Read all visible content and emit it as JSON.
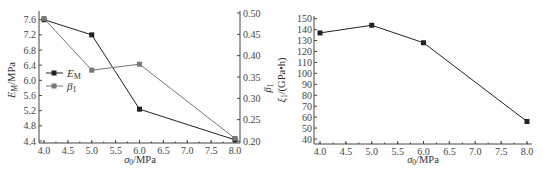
{
  "chart_data": [
    {
      "type": "line",
      "title": "",
      "xlabel": "σ0/MPa",
      "ylabel": "EM/MPa",
      "y2label": "β1",
      "x": [
        4.0,
        5.0,
        6.0,
        8.0
      ],
      "xlim": [
        4.0,
        8.0
      ],
      "ylim": [
        4.4,
        7.6
      ],
      "y2lim": [
        0.2,
        0.5
      ],
      "xticks": [
        "4.0",
        "4.5",
        "5.0",
        "5.5",
        "6.0",
        "6.5",
        "7.0",
        "7.5",
        "8.0"
      ],
      "yticks": [
        "7.6",
        "7.2",
        "6.8",
        "6.4",
        "6.0",
        "5.6",
        "5.2",
        "4.8",
        "4.4"
      ],
      "y2ticks": [
        "0.50",
        "0.45",
        "0.40",
        "0.35",
        "0.30",
        "0.25",
        "0.20"
      ],
      "grid": false,
      "legend_position": "left-middle",
      "series": [
        {
          "name": "EM",
          "axis": "left",
          "color": "#222222",
          "values": [
            7.6,
            7.2,
            5.24,
            4.43
          ]
        },
        {
          "name": "β1",
          "axis": "right",
          "color": "#777777",
          "values": [
            0.487,
            0.366,
            0.38,
            0.206
          ]
        }
      ]
    },
    {
      "type": "line",
      "title": "",
      "xlabel": "σ0/MPa",
      "ylabel": "ξ1/(GPa·h)",
      "x": [
        4.0,
        5.0,
        6.0,
        8.0
      ],
      "xlim": [
        4.0,
        8.0
      ],
      "ylim": [
        40,
        150
      ],
      "xticks": [
        "4.0",
        "4.5",
        "5.0",
        "5.5",
        "6.0",
        "6.5",
        "7.0",
        "7.5",
        "8.0"
      ],
      "yticks": [
        "150",
        "140",
        "130",
        "120",
        "110",
        "100",
        "90",
        "80",
        "70",
        "60",
        "50",
        "40"
      ],
      "grid": false,
      "series": [
        {
          "name": "ξ1",
          "color": "#222222",
          "values": [
            137,
            144,
            128,
            56
          ]
        }
      ]
    }
  ],
  "labels": {
    "left_ylabel_main": "E",
    "left_ylabel_sub": "M",
    "left_ylabel_unit": "/MPa",
    "left_y2label_main": "β",
    "left_y2label_sub": "1",
    "xlabel_main": "σ",
    "xlabel_sub": "0",
    "xlabel_unit": "/MPa",
    "right_ylabel_main": "ξ",
    "right_ylabel_sub": "1",
    "right_ylabel_unit": "/(GPa•h)",
    "legend_em_main": "E",
    "legend_em_sub": "M",
    "legend_beta_main": "β",
    "legend_beta_sub": "1"
  }
}
